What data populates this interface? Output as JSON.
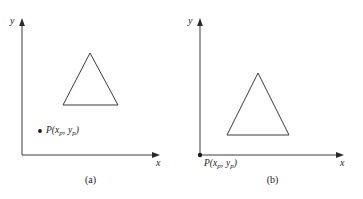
{
  "figure": {
    "background_color": "#ffffff",
    "line_color": "#3a3a3a",
    "text_color": "#1a1a1a"
  },
  "panels": [
    {
      "id": "a",
      "caption": "(a)",
      "axes": {
        "y_label": "y",
        "x_label": "x",
        "origin_x": 22,
        "origin_y": 155,
        "y_top": 20,
        "x_right": 160
      },
      "triangle": {
        "apex_x": 90,
        "apex_y": 53,
        "base_left_x": 63,
        "base_right_x": 118,
        "base_y": 105
      },
      "point": {
        "label_P": "P",
        "label_open": "(",
        "label_x": "x",
        "label_x_sub": "p",
        "label_comma": ",",
        "label_y": "y",
        "label_y_sub": "p",
        "label_close": ")",
        "dot_x": 40,
        "dot_y": 131,
        "dot_visible": true,
        "label_left": 46,
        "label_top": 126
      }
    },
    {
      "id": "b",
      "caption": "(b)",
      "axes": {
        "y_label": "y",
        "x_label": "x",
        "origin_x": 18,
        "origin_y": 155,
        "y_top": 20,
        "x_right": 162
      },
      "triangle": {
        "apex_x": 76,
        "apex_y": 73,
        "base_left_x": 45,
        "base_right_x": 107,
        "base_y": 135
      },
      "point": {
        "label_P": "P",
        "label_open": "(",
        "label_x": "x",
        "label_x_sub": "p",
        "label_comma": ",",
        "label_y": "y",
        "label_y_sub": "p",
        "label_close": ")",
        "dot_x": 18,
        "dot_y": 155,
        "dot_visible": true,
        "label_left": 22,
        "label_top": 159
      }
    }
  ]
}
